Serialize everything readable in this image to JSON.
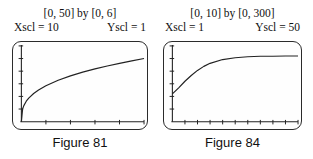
{
  "page": {
    "background": "#ffffff",
    "ink": "#222222",
    "text_color": "#111111"
  },
  "figures": [
    {
      "window_label": "[0, 50] by [0, 6]",
      "xscl_label": "Xscl = 10",
      "yscl_label": "Yscl = 1",
      "caption": "Figure 81"
    },
    {
      "window_label": "[0, 10] by [0, 300]",
      "xscl_label": "Xscl = 1",
      "yscl_label": "Yscl = 50",
      "caption": "Figure 84"
    }
  ],
  "chart_data": [
    {
      "type": "line",
      "title": "Figure 81",
      "window": "[0, 50] by [0, 6]",
      "xlim": [
        0,
        50
      ],
      "ylim": [
        0,
        6
      ],
      "xscl": 10,
      "yscl": 1,
      "xlabel": "",
      "ylabel": "",
      "grid": false,
      "legend": false,
      "x": [
        0,
        0.5,
        1,
        2,
        3,
        5,
        7,
        10,
        15,
        20,
        25,
        30,
        35,
        40,
        45,
        50
      ],
      "y": [
        0,
        1.0,
        1.27,
        1.62,
        1.87,
        2.23,
        2.51,
        2.85,
        3.28,
        3.63,
        3.92,
        4.18,
        4.41,
        4.62,
        4.82,
        5.0
      ],
      "description": "Increasing concave-down curve rising steeply from the origin, leveling toward y ≈ 5 at x = 50"
    },
    {
      "type": "line",
      "title": "Figure 84",
      "window": "[0, 10] by [0, 300]",
      "xlim": [
        0,
        10
      ],
      "ylim": [
        0,
        300
      ],
      "xscl": 1,
      "yscl": 50,
      "xlabel": "",
      "ylabel": "",
      "grid": false,
      "legend": false,
      "x": [
        0,
        0.5,
        1,
        1.5,
        2,
        2.5,
        3,
        4,
        5,
        6,
        7,
        8,
        9,
        10
      ],
      "y": [
        110,
        134,
        160,
        183,
        203,
        219,
        231,
        246,
        253,
        257,
        259,
        259,
        260,
        260
      ],
      "description": "Logistic-type increasing curve starting near y ≈ 110 at x = 0 and leveling off near y ≈ 260"
    }
  ]
}
